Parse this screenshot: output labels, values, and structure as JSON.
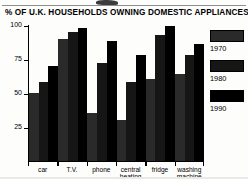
{
  "chart_data": {
    "type": "bar",
    "title": "% OF U.K. HOUSEHOLDS OWNING DOMESTIC APPLIANCES",
    "xlabel": "",
    "ylabel": "",
    "ylim": [
      0,
      100
    ],
    "yticks": [
      25,
      50,
      75,
      100
    ],
    "grid": false,
    "legend_position": "right",
    "categories": [
      "car",
      "T.V.",
      "phone",
      "central heating",
      "fridge",
      "washing machine"
    ],
    "series": [
      {
        "name": "1970",
        "color": "#2a2a2a",
        "values": [
          50,
          90,
          35,
          30,
          60,
          64
        ]
      },
      {
        "name": "1980",
        "color": "#161616",
        "values": [
          58,
          95,
          72,
          58,
          93,
          78
        ]
      },
      {
        "name": "1990",
        "color": "#000000",
        "values": [
          70,
          98,
          88,
          78,
          99,
          86
        ]
      }
    ]
  },
  "axis": {
    "y_tick_labels": [
      "100",
      "75",
      "50",
      "25"
    ]
  },
  "legend": {
    "items": [
      {
        "label": "1970"
      },
      {
        "label": "1980"
      },
      {
        "label": "1990"
      }
    ]
  },
  "colors": {
    "background": "#fdfdfc",
    "axis": "#000000",
    "series_1970": "#2a2a2a",
    "series_1980": "#161616",
    "series_1990": "#000000"
  }
}
